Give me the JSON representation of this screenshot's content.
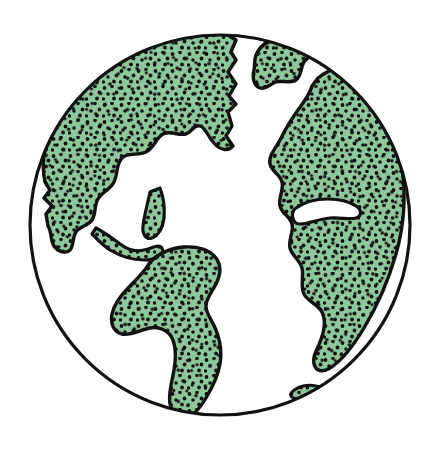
{
  "illustration": {
    "title": "Earth globe line drawing",
    "subject": "globe",
    "style": "hand-drawn ink outline with stippled fill",
    "background_color": "#ffffff",
    "canvas": {
      "width": 441,
      "height": 453
    }
  },
  "globe": {
    "name": "earth-globe",
    "outline_color": "#121212",
    "outline_width_px": 3,
    "ocean_color": "#ffffff",
    "center": {
      "x": 220,
      "y": 225
    },
    "radius": 192,
    "bounds": {
      "left": 28,
      "top": 33,
      "right": 412,
      "bottom": 417
    }
  },
  "landmasses": {
    "fill_color": "#8ec79b",
    "stipple_color": "#101010",
    "stipple_dot_radius": 1.9,
    "outline_color": "#121212",
    "outline_width_px": 3,
    "items": [
      {
        "label": "North America",
        "name": "landmass-north-america"
      },
      {
        "label": "Greenland",
        "name": "landmass-greenland"
      },
      {
        "label": "Europe and Asia",
        "name": "landmass-eurasia"
      },
      {
        "label": "Africa",
        "name": "landmass-africa"
      },
      {
        "label": "South America",
        "name": "landmass-south-america"
      },
      {
        "label": "Southern island",
        "name": "landmass-southern-island"
      }
    ]
  },
  "water_bodies": {
    "fill_color": "#ffffff",
    "items": [
      {
        "label": "Mediterranean Sea",
        "name": "water-mediterranean"
      }
    ]
  }
}
